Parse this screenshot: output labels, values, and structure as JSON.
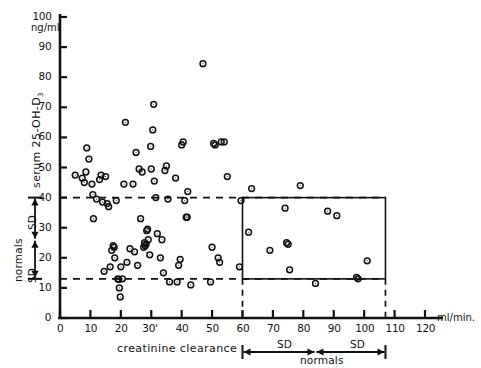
{
  "figure": {
    "kind": "scatter-plot",
    "background": "#ffffff",
    "ink_color": "#111111"
  },
  "axes": {
    "y": {
      "title": "serum  25-OH-D",
      "title_subscript": "3",
      "unit_label": "ng/ml",
      "ticks": [
        0,
        10,
        20,
        30,
        40,
        50,
        60,
        70,
        80,
        90,
        100
      ],
      "min": 0,
      "max": 100
    },
    "x": {
      "title": "creatinine  clearance",
      "unit_label": "ml/min.",
      "ticks": [
        0,
        10,
        20,
        30,
        40,
        50,
        60,
        70,
        80,
        90,
        100,
        110,
        120
      ],
      "tick_label_30": "30'",
      "min": 0,
      "max": 120
    }
  },
  "annotations": {
    "left_bracket": {
      "group_label": "normals",
      "upper_sd_label": "SD",
      "lower_sd_label": "SD",
      "upper_value": 40,
      "lower_value": 13,
      "mid_value": 26
    },
    "bottom_bracket": {
      "group_label": "normals",
      "left_sd_label": "SD",
      "right_sd_label": "SD",
      "left_value": 60,
      "mid_value": 84,
      "right_value": 107
    },
    "reference_lines": [
      {
        "name": "upper-normal-limit",
        "y": 40,
        "style": "dashed"
      },
      {
        "name": "lower-normal-limit",
        "y": 13,
        "style": "dashed"
      }
    ],
    "normal_box": {
      "x_min": 60,
      "x_max": 107,
      "y_min": 13,
      "y_max": 40,
      "style": "solid"
    },
    "box_droplines": [
      {
        "name": "box-dropline-left",
        "x": 60,
        "style": "dashed"
      },
      {
        "name": "box-dropline-right",
        "x": 107,
        "style": "dashed"
      }
    ]
  },
  "chart_data": {
    "type": "scatter",
    "title": "",
    "xlabel": "creatinine  clearance",
    "ylabel": "serum  25-OH-D3",
    "x_unit": "ml/min.",
    "y_unit": "ng/ml",
    "xlim": [
      0,
      120
    ],
    "ylim": [
      0,
      100
    ],
    "grid": false,
    "legend": "none",
    "marker": "open-circle",
    "series": [
      {
        "name": "patients",
        "points": [
          [
            5.0,
            47.5
          ],
          [
            7.3,
            46.5
          ],
          [
            8.0,
            45.0
          ],
          [
            8.5,
            48.5
          ],
          [
            8.8,
            56.5
          ],
          [
            9.5,
            52.8
          ],
          [
            10.5,
            44.5
          ],
          [
            10.8,
            41.0
          ],
          [
            11.0,
            33.0
          ],
          [
            12.0,
            39.5
          ],
          [
            13.0,
            46.0
          ],
          [
            13.5,
            47.5
          ],
          [
            14.0,
            38.5
          ],
          [
            14.5,
            15.5
          ],
          [
            15.0,
            47.0
          ],
          [
            15.5,
            38.0
          ],
          [
            16.0,
            37.0
          ],
          [
            16.5,
            17.0
          ],
          [
            17.0,
            22.5
          ],
          [
            17.5,
            24.0
          ],
          [
            17.8,
            23.5
          ],
          [
            18.0,
            20.0
          ],
          [
            18.5,
            39.0
          ],
          [
            19.0,
            13.0
          ],
          [
            19.3,
            12.8
          ],
          [
            19.5,
            10.0
          ],
          [
            19.8,
            7.0
          ],
          [
            20.0,
            17.0
          ],
          [
            20.5,
            13.0
          ],
          [
            21.0,
            44.5
          ],
          [
            21.5,
            65.0
          ],
          [
            22.0,
            18.5
          ],
          [
            23.0,
            23.0
          ],
          [
            24.0,
            44.5
          ],
          [
            24.5,
            22.0
          ],
          [
            25.0,
            55.0
          ],
          [
            25.5,
            17.5
          ],
          [
            26.0,
            49.5
          ],
          [
            26.5,
            33.0
          ],
          [
            27.0,
            48.5
          ],
          [
            27.5,
            23.5
          ],
          [
            27.8,
            25.0
          ],
          [
            28.0,
            24.0
          ],
          [
            28.3,
            24.5
          ],
          [
            28.5,
            29.0
          ],
          [
            28.8,
            29.5
          ],
          [
            29.0,
            26.0
          ],
          [
            29.5,
            21.0
          ],
          [
            29.8,
            57.0
          ],
          [
            30.0,
            49.5
          ],
          [
            30.5,
            62.5
          ],
          [
            30.8,
            71.0
          ],
          [
            31.0,
            45.5
          ],
          [
            31.5,
            40.0
          ],
          [
            32.0,
            28.0
          ],
          [
            33.0,
            20.0
          ],
          [
            33.5,
            26.0
          ],
          [
            34.0,
            15.0
          ],
          [
            34.5,
            49.0
          ],
          [
            35.0,
            50.5
          ],
          [
            35.5,
            39.5
          ],
          [
            36.0,
            12.0
          ],
          [
            38.0,
            46.5
          ],
          [
            38.5,
            12.0
          ],
          [
            39.0,
            17.5
          ],
          [
            39.5,
            19.5
          ],
          [
            40.0,
            57.5
          ],
          [
            40.5,
            58.5
          ],
          [
            41.0,
            39.0
          ],
          [
            41.5,
            33.5
          ],
          [
            41.8,
            33.5
          ],
          [
            42.0,
            42.0
          ],
          [
            43.0,
            11.0
          ],
          [
            47.0,
            84.5
          ],
          [
            49.5,
            12.0
          ],
          [
            50.0,
            23.5
          ],
          [
            50.5,
            58.0
          ],
          [
            51.0,
            57.5
          ],
          [
            52.0,
            20.0
          ],
          [
            52.5,
            18.5
          ],
          [
            53.0,
            58.5
          ],
          [
            54.0,
            58.5
          ],
          [
            55.0,
            47.0
          ],
          [
            59.0,
            17.0
          ],
          [
            59.5,
            39.0
          ],
          [
            62.0,
            28.5
          ],
          [
            63.0,
            43.0
          ],
          [
            69.0,
            22.5
          ],
          [
            74.0,
            36.5
          ],
          [
            74.5,
            25.0
          ],
          [
            75.0,
            24.5
          ],
          [
            75.5,
            16.0
          ],
          [
            79.0,
            44.0
          ],
          [
            84.0,
            11.5
          ],
          [
            88.0,
            35.5
          ],
          [
            91.0,
            34.0
          ],
          [
            97.5,
            13.5
          ],
          [
            98.0,
            13.0
          ],
          [
            101.0,
            19.0
          ]
        ]
      }
    ]
  }
}
